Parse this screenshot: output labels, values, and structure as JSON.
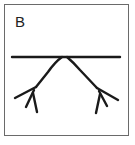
{
  "figure": {
    "panel_label": "B",
    "colors": {
      "frame": "#6a6a6a",
      "stroke": "#1a1a1a",
      "background": "#ffffff"
    }
  }
}
